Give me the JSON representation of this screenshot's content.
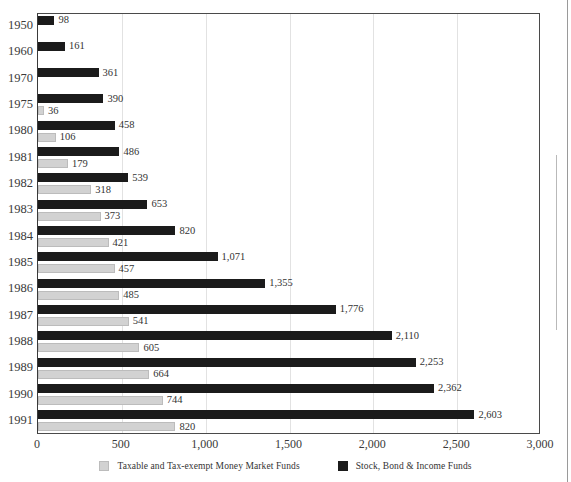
{
  "chart_data": {
    "type": "bar",
    "orientation": "horizontal",
    "title": "",
    "xlabel": "",
    "ylabel": "",
    "xlim": [
      0,
      3000
    ],
    "ylim": null,
    "grid": true,
    "legend_position": "bottom-center",
    "xticks": [
      "0",
      "500",
      "1,000",
      "1,500",
      "2,000",
      "2,500",
      "3,000"
    ],
    "xtick_values": [
      0,
      500,
      1000,
      1500,
      2000,
      2500,
      3000
    ],
    "categories": [
      "1950",
      "1960",
      "1970",
      "1975",
      "1980",
      "1981",
      "1982",
      "1983",
      "1984",
      "1985",
      "1986",
      "1987",
      "1988",
      "1989",
      "1990",
      "1991"
    ],
    "series": [
      {
        "name": "Stock, Bond & Income Funds",
        "color": "#1b1b1b",
        "values": [
          98,
          161,
          361,
          390,
          458,
          486,
          539,
          653,
          820,
          1071,
          1355,
          1776,
          2110,
          2253,
          2362,
          2603
        ],
        "labels": [
          "98",
          "161",
          "361",
          "390",
          "458",
          "486",
          "539",
          "653",
          "820",
          "1,071",
          "1,355",
          "1,776",
          "2,110",
          "2,253",
          "2,362",
          "2,603"
        ]
      },
      {
        "name": "Taxable and Tax-exempt Money Market Funds",
        "color": "#d2d2d2",
        "values": [
          null,
          null,
          null,
          36,
          106,
          179,
          318,
          373,
          421,
          457,
          485,
          541,
          605,
          664,
          744,
          820
        ],
        "labels": [
          "",
          "",
          "",
          "36",
          "106",
          "179",
          "318",
          "373",
          "421",
          "457",
          "485",
          "541",
          "605",
          "664",
          "744",
          "820"
        ]
      }
    ]
  },
  "legend": {
    "items": [
      {
        "label": "Taxable and Tax-exempt Money Market Funds",
        "swatch": "light"
      },
      {
        "label": "Stock, Bond & Income Funds",
        "swatch": "dark"
      }
    ]
  }
}
